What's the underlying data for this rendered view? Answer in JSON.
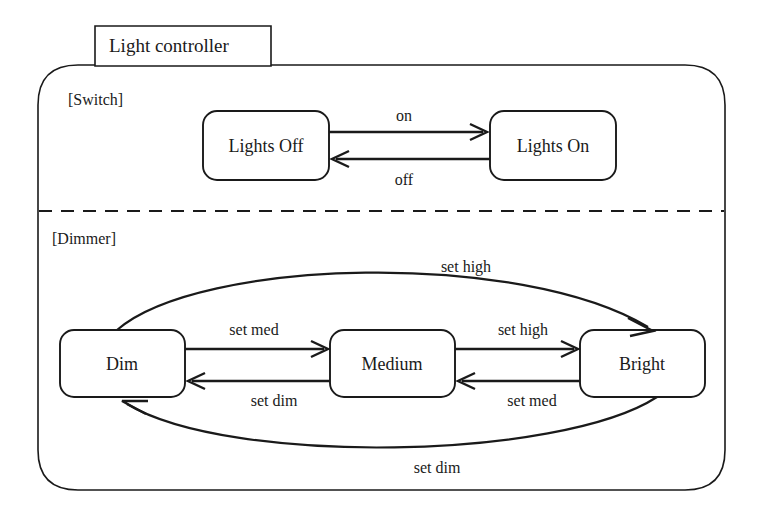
{
  "diagram": {
    "title": "Light controller",
    "regions": [
      {
        "id": "switch",
        "label": "[Switch]"
      },
      {
        "id": "dimmer",
        "label": "[Dimmer]"
      }
    ],
    "states": [
      {
        "id": "lights-off",
        "name": "Lights Off",
        "region": "switch"
      },
      {
        "id": "lights-on",
        "name": "Lights On",
        "region": "switch"
      },
      {
        "id": "dim",
        "name": "Dim",
        "region": "dimmer"
      },
      {
        "id": "medium",
        "name": "Medium",
        "region": "dimmer"
      },
      {
        "id": "bright",
        "name": "Bright",
        "region": "dimmer"
      }
    ],
    "transitions": [
      {
        "id": "off-to-on",
        "from": "lights-off",
        "to": "lights-on",
        "label": "on"
      },
      {
        "id": "on-to-off",
        "from": "lights-on",
        "to": "lights-off",
        "label": "off"
      },
      {
        "id": "dim-to-medium",
        "from": "dim",
        "to": "medium",
        "label": "set med"
      },
      {
        "id": "medium-to-dim",
        "from": "medium",
        "to": "dim",
        "label": "set dim"
      },
      {
        "id": "medium-to-bright",
        "from": "medium",
        "to": "bright",
        "label": "set high"
      },
      {
        "id": "bright-to-medium",
        "from": "bright",
        "to": "medium",
        "label": "set med"
      },
      {
        "id": "dim-to-bright",
        "from": "dim",
        "to": "bright",
        "label": "set high"
      },
      {
        "id": "bright-to-dim",
        "from": "bright",
        "to": "dim",
        "label": "set dim"
      }
    ],
    "colors": {
      "stroke": "#1a1a1a",
      "background": "#ffffff"
    }
  }
}
